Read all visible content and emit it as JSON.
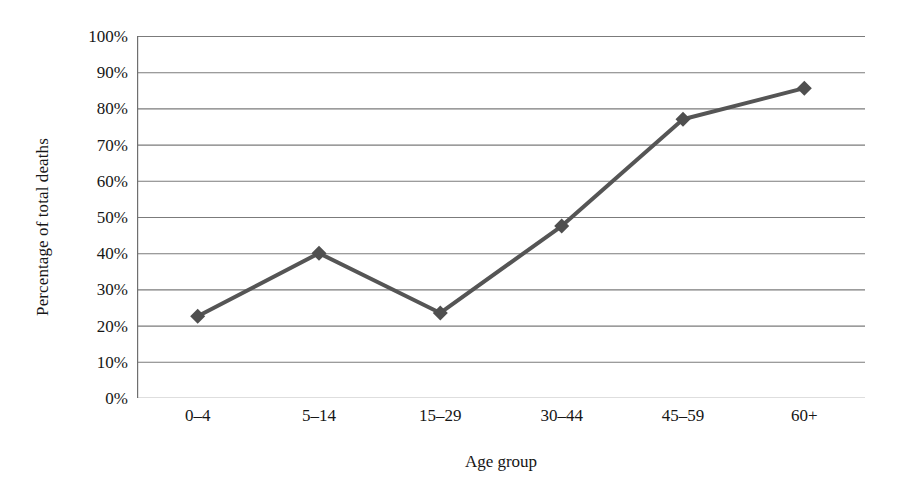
{
  "chart_data": {
    "type": "line",
    "title": "",
    "xlabel": "Age group",
    "ylabel": "Percentage of total deaths",
    "categories": [
      "0–4",
      "5–14",
      "15–29",
      "30–44",
      "45–59",
      "60+"
    ],
    "values": [
      22.6,
      40.0,
      23.5,
      47.5,
      77.0,
      85.6
    ],
    "value_labels": [
      "22.6%",
      "40%",
      "23.5%",
      "47.5%",
      "77%",
      "85.6%"
    ],
    "ylim": [
      0,
      100
    ],
    "y_ticks": [
      0,
      10,
      20,
      30,
      40,
      50,
      60,
      70,
      80,
      90,
      100
    ],
    "y_tick_labels": [
      "0%",
      "10%",
      "20%",
      "30%",
      "40%",
      "50%",
      "60%",
      "70%",
      "80%",
      "90%",
      "100%"
    ],
    "grid": true,
    "grid_axis": "y",
    "legend": false,
    "legend_position": "none",
    "series": [
      {
        "name": "Percentage of total deaths",
        "values": [
          22.6,
          40.0,
          23.5,
          47.5,
          77.0,
          85.6
        ],
        "marker": "diamond",
        "line_color": "#555555",
        "marker_color": "#4f4f4f",
        "line_width": 4
      }
    ],
    "colors": {
      "line": "#555555",
      "marker": "#4f4f4f",
      "gridline": "#7b7b7b",
      "axis": "#6f6f6f",
      "text": "#161616",
      "background": "#ffffff"
    }
  }
}
